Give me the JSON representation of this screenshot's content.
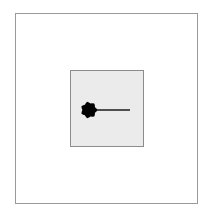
{
  "diagram": {
    "outer_frame": {
      "x": 15,
      "y": 13,
      "width": 183,
      "height": 191,
      "stroke": "#9a9a9a",
      "fill": "#ffffff"
    },
    "inner_box": {
      "x": 70,
      "y": 70,
      "width": 74,
      "height": 77,
      "stroke": "#8c8c8c",
      "fill": "#ebebeb"
    },
    "blob": {
      "cx": 89,
      "cy": 110,
      "r": 7.5,
      "fill": "#000000"
    },
    "line": {
      "x1": 95,
      "y1": 110,
      "x2": 130,
      "y2": 110,
      "stroke": "#1a1a1a"
    }
  }
}
